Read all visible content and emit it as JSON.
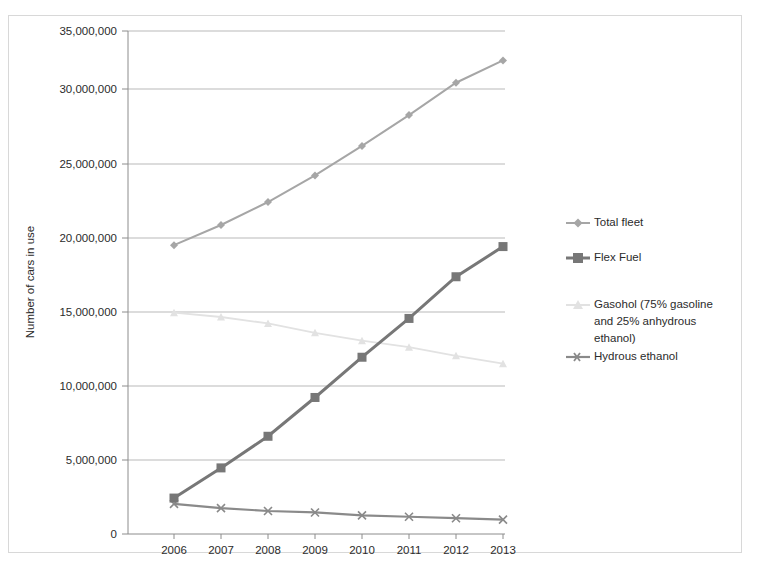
{
  "chart_data": {
    "type": "line",
    "title": "",
    "xlabel": "",
    "ylabel": "Number of cars in use",
    "x": [
      "2006",
      "2007",
      "2008",
      "2009",
      "2010",
      "2011",
      "2012",
      "2013"
    ],
    "categories": [
      "2006",
      "2007",
      "2008",
      "2009",
      "2010",
      "2011",
      "2012",
      "2013"
    ],
    "ylim": [
      0,
      35000000
    ],
    "ytick_step": 5000000,
    "ytick_labels": [
      "0",
      "5,000,000",
      "10,000,000",
      "15,000,000",
      "20,000,000",
      "25,000,000",
      "30,000,000",
      "35,000,000"
    ],
    "ytick_values": [
      0,
      5000000,
      10000000,
      15000000,
      20000000,
      25000000,
      30000000,
      35000000
    ],
    "grid": true,
    "grid_axis": "y",
    "legend_position": "right",
    "series": [
      {
        "name": "Total fleet",
        "color": "#a6a6a6",
        "marker": "diamond",
        "values": [
          20100000,
          21500000,
          23100000,
          24950000,
          27000000,
          29150000,
          31400000,
          32950000
        ]
      },
      {
        "name": "Flex Fuel",
        "color": "#777777",
        "marker": "square",
        "values": [
          2500000,
          4600000,
          6800000,
          9500000,
          12300000,
          15000000,
          17900000,
          20000000
        ]
      },
      {
        "name": "Gasohol (75% gasoline and 25% anhydrous ethanol)",
        "color": "#e2e2e2",
        "marker": "triangle",
        "values": [
          15400000,
          15100000,
          14650000,
          14000000,
          13450000,
          13000000,
          12400000,
          11850000
        ]
      },
      {
        "name": "Hydrous ethanol",
        "color": "#8a8a8a",
        "marker": "cross",
        "values": [
          2100000,
          1800000,
          1600000,
          1500000,
          1300000,
          1200000,
          1100000,
          1000000
        ]
      }
    ]
  },
  "legend": {
    "items": [
      {
        "label": "Total fleet"
      },
      {
        "label": "Flex Fuel"
      },
      {
        "label_line1": "Gasohol (75% gasoline",
        "label_line2": "and 25% anhydrous",
        "label_line3": "ethanol)"
      },
      {
        "label": "Hydrous ethanol"
      }
    ]
  },
  "colors": {
    "total_fleet": "#a6a6a6",
    "flex_fuel": "#777777",
    "gasohol": "#e2e2e2",
    "hydrous_ethanol": "#8a8a8a",
    "grid": "#b9b9b9",
    "axis": "#8c8c8c",
    "frame": "#d8d8d8",
    "text": "#2b2b2b"
  }
}
